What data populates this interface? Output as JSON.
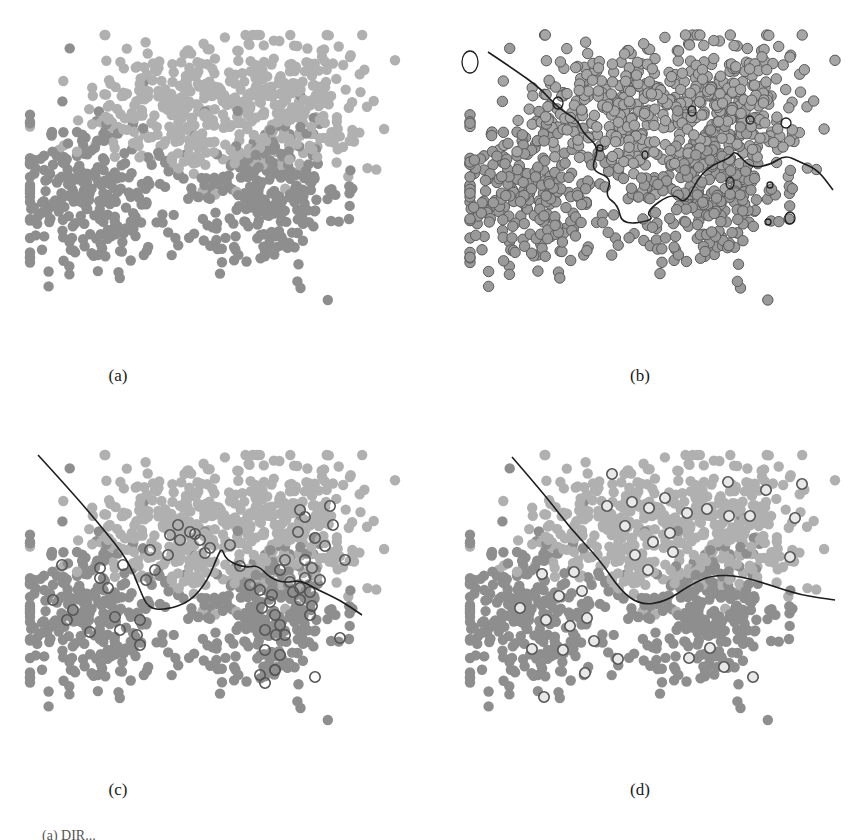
{
  "figure": {
    "panels": [
      {
        "id": "a",
        "label": "(a)",
        "left": 0,
        "top": 0,
        "label_x": 118,
        "label_y": 366,
        "style": "filled",
        "boundary": null,
        "labeled_style": null
      },
      {
        "id": "b",
        "label": "(b)",
        "left": 440,
        "top": 0,
        "label_x": 640,
        "label_y": 366,
        "style": "ringed",
        "boundary": "wiggly_b",
        "labeled_style": null
      },
      {
        "id": "c",
        "label": "(c)",
        "left": 0,
        "top": 420,
        "label_x": 118,
        "label_y": 780,
        "style": "filled",
        "boundary": "curve_c",
        "labeled_style": "dark_ring"
      },
      {
        "id": "d",
        "label": "(d)",
        "left": 440,
        "top": 420,
        "label_x": 640,
        "label_y": 780,
        "style": "filled",
        "boundary": "curve_d",
        "labeled_style": "hollow_ring"
      }
    ],
    "caption_fragment": "(a) DIR..."
  },
  "colors": {
    "class_light": "#b0b0b0",
    "class_dark": "#8e8e8e",
    "ring_stroke": "#5a5a5a",
    "ring_fill": "#9a9a9a",
    "boundary": "#1e1e1e",
    "labeled_ring": "#555555"
  },
  "chart_data": {
    "type": "scatter",
    "xlabel": "",
    "ylabel": "",
    "grid": false,
    "legend": null,
    "panel_size": [
      420,
      330
    ],
    "clusters": [
      {
        "name": "upper-left",
        "class": "light",
        "cx": 175,
        "cy": 110,
        "sx": 45,
        "sy": 35,
        "n": 260
      },
      {
        "name": "upper-right",
        "class": "light",
        "cx": 290,
        "cy": 100,
        "sx": 40,
        "sy": 35,
        "n": 260
      },
      {
        "name": "lower-left",
        "class": "dark",
        "cx": 90,
        "cy": 195,
        "sx": 40,
        "sy": 38,
        "n": 260
      },
      {
        "name": "lower-right",
        "class": "dark",
        "cx": 265,
        "cy": 195,
        "sx": 38,
        "sy": 38,
        "n": 260
      }
    ],
    "point_radius": 5.2,
    "boundaries": {
      "wiggly_b": [
        [
          48,
          52
        ],
        [
          75,
          70
        ],
        [
          100,
          88
        ],
        [
          118,
          108
        ],
        [
          138,
          120
        ],
        [
          142,
          132
        ],
        [
          160,
          148
        ],
        [
          150,
          170
        ],
        [
          172,
          178
        ],
        [
          165,
          196
        ],
        [
          178,
          205
        ],
        [
          182,
          225
        ],
        [
          215,
          220
        ],
        [
          205,
          212
        ],
        [
          233,
          192
        ],
        [
          245,
          205
        ],
        [
          258,
          178
        ],
        [
          272,
          165
        ],
        [
          290,
          158
        ],
        [
          295,
          150
        ],
        [
          310,
          168
        ],
        [
          330,
          165
        ],
        [
          345,
          155
        ],
        [
          360,
          162
        ],
        [
          378,
          170
        ],
        [
          393,
          190
        ]
      ],
      "curve_c": [
        [
          38,
          35
        ],
        [
          70,
          70
        ],
        [
          100,
          105
        ],
        [
          128,
          140
        ],
        [
          140,
          170
        ],
        [
          148,
          188
        ],
        [
          165,
          190
        ],
        [
          190,
          182
        ],
        [
          208,
          160
        ],
        [
          218,
          135
        ],
        [
          222,
          128
        ],
        [
          226,
          140
        ],
        [
          245,
          148
        ],
        [
          258,
          145
        ],
        [
          270,
          158
        ],
        [
          285,
          163
        ],
        [
          300,
          160
        ],
        [
          318,
          170
        ],
        [
          340,
          180
        ],
        [
          362,
          195
        ]
      ],
      "curve_d": [
        [
          72,
          37
        ],
        [
          105,
          75
        ],
        [
          130,
          108
        ],
        [
          160,
          140
        ],
        [
          180,
          170
        ],
        [
          200,
          185
        ],
        [
          225,
          182
        ],
        [
          250,
          165
        ],
        [
          272,
          155
        ],
        [
          300,
          156
        ],
        [
          330,
          165
        ],
        [
          360,
          175
        ],
        [
          395,
          180
        ]
      ]
    },
    "labeled_points": {
      "c": [
        [
          62,
          145
        ],
        [
          53,
          180
        ],
        [
          73,
          190
        ],
        [
          67,
          200
        ],
        [
          100,
          148
        ],
        [
          100,
          158
        ],
        [
          108,
          168
        ],
        [
          123,
          145
        ],
        [
          115,
          197
        ],
        [
          120,
          210
        ],
        [
          90,
          212
        ],
        [
          137,
          215
        ],
        [
          140,
          200
        ],
        [
          140,
          225
        ],
        [
          146,
          160
        ],
        [
          155,
          150
        ],
        [
          170,
          115
        ],
        [
          178,
          105
        ],
        [
          190,
          112
        ],
        [
          195,
          114
        ],
        [
          150,
          130
        ],
        [
          168,
          135
        ],
        [
          180,
          120
        ],
        [
          200,
          120
        ],
        [
          205,
          133
        ],
        [
          210,
          128
        ],
        [
          230,
          125
        ],
        [
          240,
          146
        ],
        [
          250,
          165
        ],
        [
          260,
          170
        ],
        [
          262,
          188
        ],
        [
          270,
          182
        ],
        [
          272,
          175
        ],
        [
          275,
          195
        ],
        [
          280,
          205
        ],
        [
          276,
          215
        ],
        [
          265,
          210
        ],
        [
          265,
          230
        ],
        [
          280,
          235
        ],
        [
          260,
          255
        ],
        [
          275,
          250
        ],
        [
          285,
          215
        ],
        [
          290,
          162
        ],
        [
          280,
          150
        ],
        [
          285,
          140
        ],
        [
          293,
          172
        ],
        [
          300,
          168
        ],
        [
          305,
          158
        ],
        [
          312,
          148
        ],
        [
          300,
          90
        ],
        [
          298,
          112
        ],
        [
          305,
          97
        ],
        [
          315,
          118
        ],
        [
          333,
          105
        ],
        [
          330,
          86
        ],
        [
          325,
          126
        ],
        [
          305,
          140
        ],
        [
          320,
          160
        ],
        [
          310,
          172
        ],
        [
          300,
          180
        ],
        [
          312,
          186
        ],
        [
          345,
          140
        ],
        [
          310,
          195
        ],
        [
          275,
          250
        ],
        [
          265,
          263
        ],
        [
          315,
          257
        ],
        [
          340,
          218
        ]
      ],
      "d": [
        [
          172,
          54
        ],
        [
          167,
          86
        ],
        [
          192,
          82
        ],
        [
          209,
          88
        ],
        [
          225,
          78
        ],
        [
          185,
          106
        ],
        [
          213,
          122
        ],
        [
          230,
          113
        ],
        [
          233,
          132
        ],
        [
          195,
          135
        ],
        [
          208,
          150
        ],
        [
          247,
          93
        ],
        [
          267,
          89
        ],
        [
          289,
          96
        ],
        [
          310,
          96
        ],
        [
          326,
          70
        ],
        [
          288,
          62
        ],
        [
          355,
          98
        ],
        [
          362,
          64
        ],
        [
          350,
          137
        ],
        [
          80,
          188
        ],
        [
          102,
          154
        ],
        [
          134,
          152
        ],
        [
          119,
          176
        ],
        [
          142,
          171
        ],
        [
          106,
          200
        ],
        [
          130,
          206
        ],
        [
          147,
          198
        ],
        [
          154,
          221
        ],
        [
          92,
          229
        ],
        [
          123,
          230
        ],
        [
          145,
          253
        ],
        [
          104,
          277
        ],
        [
          178,
          239
        ],
        [
          249,
          238
        ],
        [
          270,
          228
        ],
        [
          284,
          247
        ],
        [
          313,
          257
        ]
      ]
    }
  }
}
